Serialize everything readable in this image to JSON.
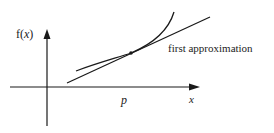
{
  "diagram": {
    "y_axis_label": {
      "prefix": "f(",
      "var": "x",
      "suffix": ")"
    },
    "x_axis_label": "x",
    "point_label": "p",
    "tangent_label": "first approximation",
    "colors": {
      "ink": "#1a1a1a",
      "background": "#ffffff"
    }
  }
}
